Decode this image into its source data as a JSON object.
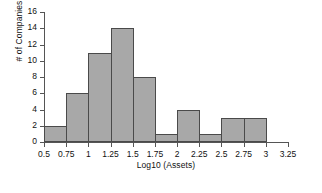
{
  "chart_data": {
    "type": "bar",
    "title": "",
    "subtitle": "",
    "xlabel": "Log10 (Assets)",
    "ylabel": "# of Companies",
    "grid": false,
    "legend": null,
    "legend_position": "none",
    "bin_width": 0.25,
    "xlim": [
      0.5,
      3.25
    ],
    "ylim": [
      0,
      16
    ],
    "xticks": [
      "0.5",
      "0.75",
      "1",
      "1.25",
      "1.5",
      "1.75",
      "2",
      "2.25",
      "2.5",
      "2.75",
      "3",
      "3.25"
    ],
    "xtick_values": [
      0.5,
      0.75,
      1,
      1.25,
      1.5,
      1.75,
      2,
      2.25,
      2.5,
      2.75,
      3,
      3.25
    ],
    "yticks": [
      "0",
      "2",
      "4",
      "6",
      "8",
      "10",
      "12",
      "14",
      "16"
    ],
    "ytick_values": [
      0,
      2,
      4,
      6,
      8,
      10,
      12,
      14,
      16
    ],
    "bin_edges": [
      0.5,
      0.75,
      1.0,
      1.25,
      1.5,
      1.75,
      2.0,
      2.25,
      2.5,
      2.75,
      3.0
    ],
    "categories": [
      "0.5-0.75",
      "0.75-1",
      "1-1.25",
      "1.25-1.5",
      "1.5-1.75",
      "1.75-2",
      "2-2.25",
      "2.25-2.5",
      "2.5-2.75",
      "2.75-3"
    ],
    "values": [
      2,
      6,
      11,
      14,
      8,
      1,
      4,
      1,
      3,
      3
    ],
    "bar_fill_color": "#a8a8a8",
    "bar_edge_color": "#4a4a4a",
    "axis_color": "#555555",
    "background_color": "#ffffff"
  }
}
